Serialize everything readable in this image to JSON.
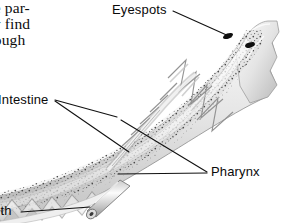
{
  "figure": {
    "organism": "lancelet",
    "view": "longitudinal section, anterior end",
    "background_color": "#ffffff",
    "ink_color": "#0a0a0a",
    "leader_line_color": "#111111"
  },
  "body_text": {
    "font_style": "serif",
    "clipped_at_left_margin": true,
    "lines": [
      "ne par-",
      "ey find",
      "hough"
    ]
  },
  "labels": {
    "eyespots": "Eyespots",
    "intestine": "Intestine",
    "pharynx": "Pharynx",
    "mouth": "uth"
  },
  "callouts": [
    {
      "name": "eyespots",
      "label": "Eyespots",
      "label_x": 112,
      "label_y": 2,
      "leaders": [
        [
          [
            173,
            11
          ],
          [
            231,
            37
          ]
        ]
      ]
    },
    {
      "name": "intestine",
      "label": "Intestine",
      "label_x": -2,
      "label_y": 92,
      "leaders": [
        [
          [
            55,
            100
          ],
          [
            117,
            117
          ]
        ],
        [
          [
            55,
            101
          ],
          [
            129,
            152
          ]
        ]
      ]
    },
    {
      "name": "pharynx",
      "label": "Pharynx",
      "label_x": 211,
      "label_y": 164,
      "leaders": [
        [
          [
            207,
            172
          ],
          [
            121,
            120
          ]
        ],
        [
          [
            207,
            173
          ],
          [
            118,
            174
          ]
        ]
      ]
    },
    {
      "name": "mouth",
      "label": "uth",
      "label_x": -7,
      "label_y": 203,
      "leaders": [
        [
          [
            21,
            212
          ],
          [
            90,
            207
          ]
        ]
      ]
    }
  ],
  "anatomy": {
    "eyespots": [
      {
        "cx": 228,
        "cy": 36,
        "rx": 5.2,
        "ry": 2.6,
        "rotation": -22,
        "color": "#111111"
      },
      {
        "cx": 250,
        "cy": 45,
        "rx": 5.0,
        "ry": 2.4,
        "rotation": -18,
        "color": "#111111"
      }
    ],
    "mouth_tube": {
      "tip_x": 90,
      "tip_y": 213,
      "base_x": 122,
      "base_y": 184,
      "opening_color": "#2a2a2a"
    },
    "myotome_chevrons": 11,
    "notochord": "pale band running anterior-posterior",
    "pharynx_bars": 9
  },
  "palette": {
    "paper": "#ffffff",
    "tissue_light": "#f2f2f2",
    "tissue_mid": "#d8d8d8",
    "tissue_dark": "#9a9a9a",
    "outline": "#6e6e6e",
    "stipple": "#3a3a3a",
    "ink": "#0a0a0a"
  }
}
